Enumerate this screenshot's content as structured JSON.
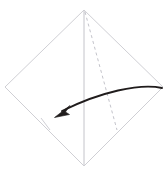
{
  "figure": {
    "kind": "origami-fold-diagram",
    "title": "",
    "caption": "",
    "background_color": "#ffffff",
    "canvas": {
      "width": 168,
      "height": 170
    }
  },
  "colors": {
    "paper_edge": "#c9c9cf",
    "crease_solid": "#bdbdc4",
    "crease_dashed": "#bcbcc4",
    "arrow": "#201c1c",
    "tick_mark": "#c3c3ca",
    "paper_fill": "#ffffff"
  },
  "shapes": {
    "sheet": {
      "name": "square-sheet-diamond-orientation",
      "points": "84,10 163,87 84,166 5,87",
      "stroke_width": 0.9
    },
    "vertical_crease": {
      "name": "vertical-center-crease",
      "x1": 84,
      "y1": 11,
      "x2": 84,
      "y2": 165,
      "stroke_width": 0.9,
      "style": "solid"
    },
    "diagonal_fold_line": {
      "name": "diagonal-fold-crease",
      "x1": 85,
      "y1": 12,
      "x2": 117,
      "y2": 130,
      "stroke_width": 0.9,
      "style": "dashed",
      "dash_pattern": "3 3"
    },
    "tick_mark": {
      "name": "edge-reference-tick",
      "x1": 41,
      "y1": 118,
      "x2": 50,
      "y2": 130,
      "stroke_width": 0.8
    },
    "fold_arrow": {
      "name": "fold-direction-arrow",
      "path": "M 162,88 C 140,83 100,92 62,111",
      "stroke_width": 1.9,
      "head_points": "55,117 70,106 66,112 69,114",
      "head_tip": {
        "x": 55,
        "y": 117
      },
      "tail_origin": {
        "x": 162,
        "y": 88
      },
      "direction": "right-to-left"
    }
  },
  "labels": {
    "none": ""
  }
}
